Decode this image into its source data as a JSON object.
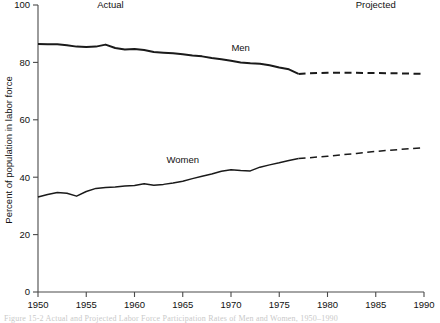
{
  "chart_data": {
    "type": "line",
    "title": "",
    "xlabel": "",
    "ylabel": "Percent of population in labor force",
    "xlim": [
      1950,
      1990
    ],
    "ylim": [
      0,
      100
    ],
    "grid": false,
    "legend_position": "inline",
    "x_ticks": [
      1950,
      1955,
      1960,
      1965,
      1970,
      1975,
      1980,
      1985,
      1990
    ],
    "y_ticks": [
      0,
      20,
      40,
      60,
      80,
      100
    ],
    "annotations": [
      {
        "text": "Actual",
        "x": 1957.5,
        "y": 99
      },
      {
        "text": "Projected",
        "x": 1985,
        "y": 99
      }
    ],
    "series": [
      {
        "name": "Men",
        "label_x": 1971,
        "label_y": 84,
        "actual_end_year": 1977,
        "x": [
          1950,
          1951,
          1952,
          1953,
          1954,
          1955,
          1956,
          1957,
          1958,
          1959,
          1960,
          1961,
          1962,
          1963,
          1964,
          1965,
          1966,
          1967,
          1968,
          1969,
          1970,
          1971,
          1972,
          1973,
          1974,
          1975,
          1976,
          1977
        ],
        "values": [
          86.4,
          86.3,
          86.3,
          86.0,
          85.5,
          85.4,
          85.5,
          86.2,
          85.0,
          84.5,
          84.7,
          84.3,
          83.6,
          83.4,
          83.2,
          82.8,
          82.4,
          82.1,
          81.5,
          81.1,
          80.6,
          80.0,
          79.7,
          79.5,
          79.0,
          78.2,
          77.6,
          76.0
        ]
      },
      {
        "name": "Men",
        "projection": true,
        "x": [
          1977,
          1978,
          1980,
          1982,
          1985,
          1987,
          1990
        ],
        "values": [
          76.0,
          76.2,
          76.4,
          76.4,
          76.3,
          76.2,
          76.0
        ]
      },
      {
        "name": "Women",
        "label_x": 1965,
        "label_y": 45,
        "actual_end_year": 1977,
        "x": [
          1950,
          1951,
          1952,
          1953,
          1954,
          1955,
          1956,
          1957,
          1958,
          1959,
          1960,
          1961,
          1962,
          1963,
          1964,
          1965,
          1966,
          1967,
          1968,
          1969,
          1970,
          1971,
          1972,
          1973,
          1974,
          1975,
          1976,
          1977
        ],
        "values": [
          33.1,
          34.0,
          34.7,
          34.4,
          33.4,
          35.0,
          36.1,
          36.4,
          36.6,
          36.9,
          37.1,
          37.7,
          37.2,
          37.5,
          38.0,
          38.6,
          39.5,
          40.3,
          41.1,
          42.1,
          42.6,
          42.3,
          42.2,
          43.5,
          44.3,
          45.0,
          45.8,
          46.5
        ]
      },
      {
        "name": "Women",
        "projection": true,
        "x": [
          1977,
          1980,
          1983,
          1986,
          1990
        ],
        "values": [
          46.5,
          47.3,
          48.3,
          49.3,
          50.3
        ]
      }
    ]
  },
  "figure": {
    "caption": "Figure 15-2   Actual and Projected Labor Force Participation Rates of Men and Women, 1950–1990"
  },
  "colors": {
    "line": "#1a1a1a",
    "axis": "#4a4a4a",
    "text": "#111111",
    "background": "#ffffff"
  }
}
